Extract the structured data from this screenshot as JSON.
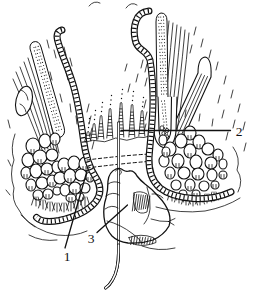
{
  "figure": {
    "background": "#ffffff",
    "ink": "#111111",
    "labels": [
      {
        "text": "1"
      },
      {
        "text": "2"
      },
      {
        "text": "3"
      }
    ]
  }
}
